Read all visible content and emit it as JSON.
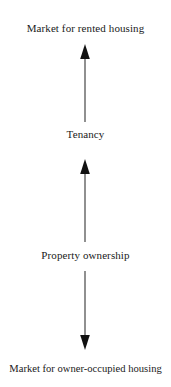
{
  "diagram": {
    "title": "",
    "background_color": "#ffffff",
    "line_color": "#6b6b6b",
    "arrowhead_color": "#111111",
    "text_color": "#1a1a1a",
    "nodes": [
      {
        "id": "rented-market",
        "label": "Market for rented housing"
      },
      {
        "id": "tenancy",
        "label": "Tenancy"
      },
      {
        "id": "ownership",
        "label": "Property ownership"
      },
      {
        "id": "owner-market",
        "label": "Market for owner-occupied housing"
      }
    ],
    "connectors": [
      {
        "id": "tenancy-to-rented-market",
        "direction": "up",
        "from": "tenancy",
        "to": "rented-market"
      },
      {
        "id": "ownership-to-tenancy",
        "direction": "up",
        "from": "ownership",
        "to": "tenancy"
      },
      {
        "id": "ownership-to-owner-market",
        "direction": "down",
        "from": "ownership",
        "to": "owner-market"
      }
    ]
  }
}
